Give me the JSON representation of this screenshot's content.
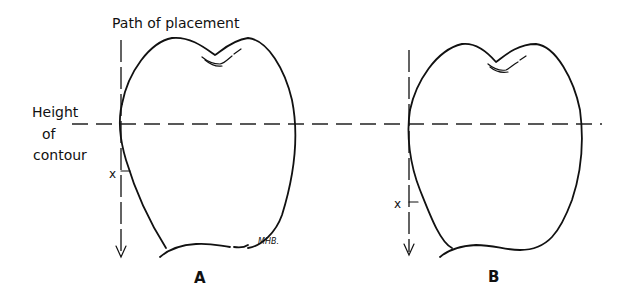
{
  "diagram": {
    "labels": {
      "path_of_placement": "Path of placement",
      "height": "Height",
      "of": "of",
      "contour": "contour",
      "x_a": "x",
      "x_b": "x",
      "figure_a": "A",
      "figure_b": "B",
      "signature": "MHB."
    },
    "figures": [
      {
        "id": "A",
        "description": "Tooth crown outline with path of placement and undercut depth x"
      },
      {
        "id": "B",
        "description": "Tooth crown outline with path of placement and deeper undercut x"
      }
    ],
    "colors": {
      "line": "#111111",
      "background": "#ffffff"
    }
  }
}
